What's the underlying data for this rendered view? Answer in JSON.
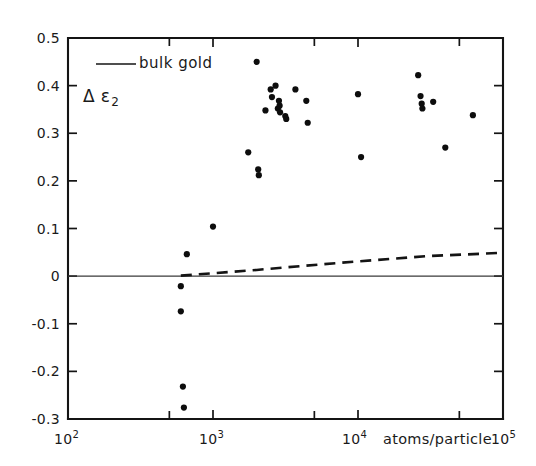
{
  "chart_data": {
    "type": "scatter",
    "title": "",
    "xlabel": "atoms/particle",
    "ylabel": "Δ ε₂",
    "xscale": "log",
    "xlim": [
      100,
      100000
    ],
    "ylim": [
      -0.3,
      0.5
    ],
    "grid": false,
    "legend_position": "top-left",
    "x_tick_labels": [
      "10²",
      "10³",
      "10⁴",
      "10⁵"
    ],
    "x_tick_values": [
      100,
      1000,
      10000,
      100000
    ],
    "y_tick_labels": [
      "0.5",
      "0.4",
      "0.3",
      "0.2",
      "0.1",
      "0",
      "-0.1",
      "-0.2",
      "-0.3"
    ],
    "y_tick_values": [
      0.5,
      0.4,
      0.3,
      0.2,
      0.1,
      0,
      -0.1,
      -0.2,
      -0.3
    ],
    "series": [
      {
        "name": "bulk gold",
        "type": "line",
        "style": "solid",
        "points": [
          [
            100,
            0
          ],
          [
            100000,
            0
          ]
        ]
      },
      {
        "name": "size-dependent model",
        "type": "line",
        "style": "dashed",
        "points": [
          [
            600,
            0.001
          ],
          [
            1000,
            0.006
          ],
          [
            2000,
            0.013
          ],
          [
            4000,
            0.021
          ],
          [
            10000,
            0.031
          ],
          [
            30000,
            0.042
          ],
          [
            100000,
            0.049
          ]
        ]
      },
      {
        "name": "measured particles",
        "type": "scatter",
        "points": [
          [
            600,
            -0.021
          ],
          [
            600,
            -0.074
          ],
          [
            620,
            -0.232
          ],
          [
            630,
            -0.276
          ],
          [
            660,
            0.046
          ],
          [
            1000,
            0.104
          ],
          [
            1750,
            0.26
          ],
          [
            2000,
            0.45
          ],
          [
            2050,
            0.224
          ],
          [
            2070,
            0.212
          ],
          [
            2500,
            0.392
          ],
          [
            2550,
            0.376
          ],
          [
            2700,
            0.4
          ],
          [
            2800,
            0.352
          ],
          [
            2850,
            0.368
          ],
          [
            2880,
            0.358
          ],
          [
            2900,
            0.344
          ],
          [
            2300,
            0.348
          ],
          [
            3150,
            0.336
          ],
          [
            3200,
            0.33
          ],
          [
            3700,
            0.392
          ],
          [
            4400,
            0.368
          ],
          [
            4500,
            0.322
          ],
          [
            10000,
            0.382
          ],
          [
            10500,
            0.25
          ],
          [
            26000,
            0.422
          ],
          [
            27000,
            0.378
          ],
          [
            27500,
            0.362
          ],
          [
            27800,
            0.352
          ],
          [
            33000,
            0.366
          ],
          [
            40000,
            0.27
          ],
          [
            62000,
            0.338
          ]
        ]
      }
    ],
    "legend_entries": [
      {
        "label": "bulk gold",
        "style": "solid-line"
      }
    ]
  },
  "labels": {
    "y_axis": {
      "delta": "Δ",
      "epsilon": "ε",
      "subscript": "2"
    },
    "x_axis_name": "atoms/particle",
    "legend_label": "bulk gold",
    "x_ticks": [
      {
        "mantissa": "10",
        "exponent": "2"
      },
      {
        "mantissa": "10",
        "exponent": "3"
      },
      {
        "mantissa": "10",
        "exponent": "4"
      },
      {
        "mantissa": "10",
        "exponent": "5"
      }
    ],
    "y_ticks": [
      "0.5",
      "0.4",
      "0.3",
      "0.2",
      "0.1",
      "0",
      "-0.1",
      "-0.2",
      "-0.3"
    ]
  }
}
